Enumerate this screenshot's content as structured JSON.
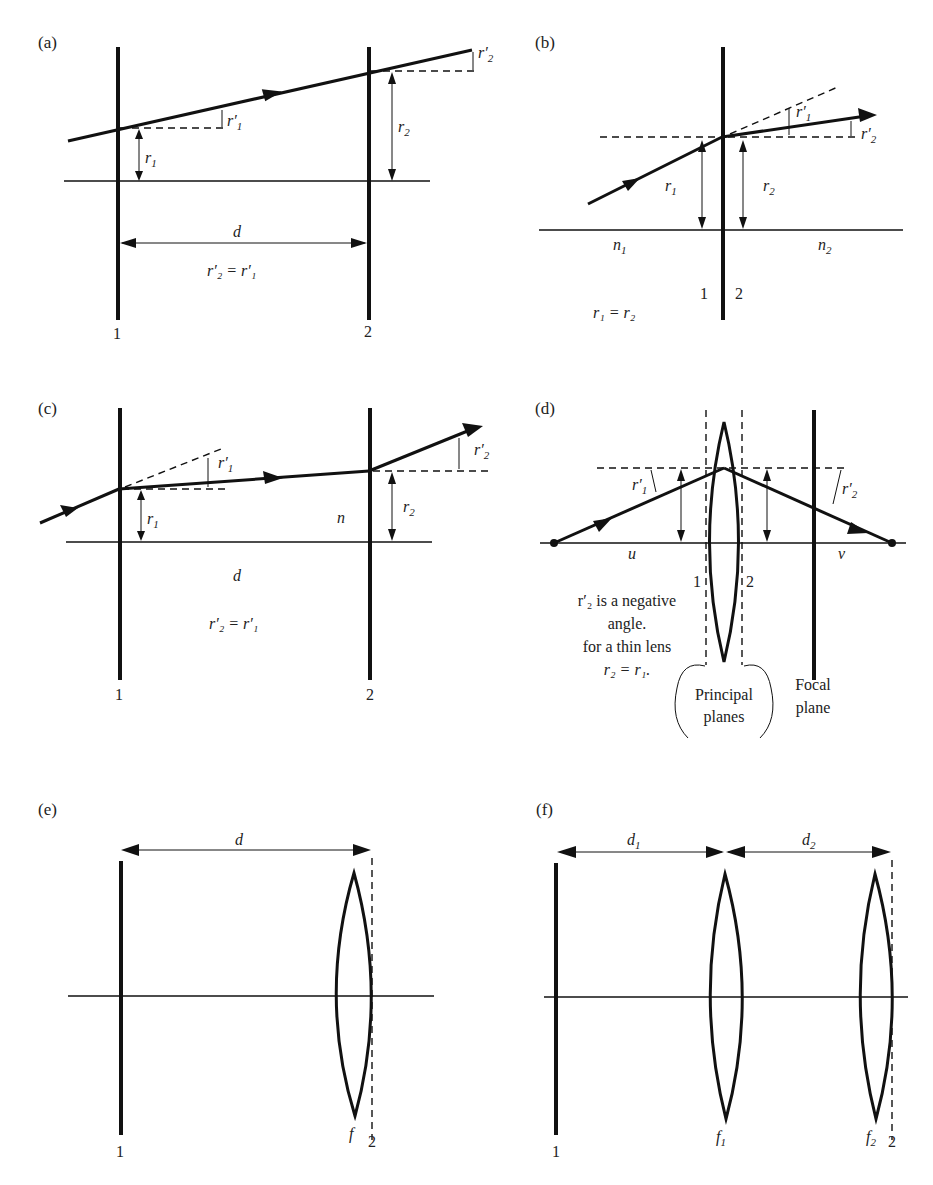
{
  "figure": {
    "panels": [
      {
        "id": "a",
        "label": "(a)",
        "plane_labels": [
          "1",
          "2"
        ],
        "symbols": {
          "r1": "r",
          "r1_sub": "1",
          "r1p": "r′",
          "r1p_sub": "1",
          "r2": "r",
          "r2_sub": "2",
          "r2p": "r′",
          "r2p_sub": "2",
          "d": "d"
        },
        "equation": "r′₂ = r′₁"
      },
      {
        "id": "b",
        "label": "(b)",
        "plane_labels": [
          "1",
          "2"
        ],
        "symbols": {
          "r1": "r",
          "r1_sub": "1",
          "r2": "r",
          "r2_sub": "2",
          "r1p": "r′",
          "r1p_sub": "1",
          "r2p": "r′",
          "r2p_sub": "2",
          "n1": "n",
          "n1_sub": "1",
          "n2": "n",
          "n2_sub": "2"
        },
        "equation": "r₁ = r₂"
      },
      {
        "id": "c",
        "label": "(c)",
        "plane_labels": [
          "1",
          "2"
        ],
        "symbols": {
          "r1": "r",
          "r1_sub": "1",
          "r1p": "r′",
          "r1p_sub": "1",
          "r2": "r",
          "r2_sub": "2",
          "r2p": "r′",
          "r2p_sub": "2",
          "n": "n",
          "d": "d"
        },
        "equation": "r′₂ = r′₁"
      },
      {
        "id": "d",
        "label": "(d)",
        "plane_labels": [
          "1",
          "2"
        ],
        "symbols": {
          "r1p": "r′",
          "r1p_sub": "1",
          "r2p": "r′",
          "r2p_sub": "2",
          "u": "u",
          "v": "v"
        },
        "note_lines": [
          "r′₂ is a negative",
          "angle.",
          "for a thin lens",
          "r₂ = r₁."
        ],
        "principal_planes": [
          "Principal",
          "planes"
        ],
        "focal_plane": [
          "Focal",
          "plane"
        ]
      },
      {
        "id": "e",
        "label": "(e)",
        "plane_labels": [
          "1",
          "2"
        ],
        "symbols": {
          "d": "d",
          "f": "f"
        }
      },
      {
        "id": "f",
        "label": "(f)",
        "plane_labels": [
          "1",
          "2"
        ],
        "symbols": {
          "d1": "d",
          "d1_sub": "1",
          "d2": "d",
          "d2_sub": "2",
          "f1": "f",
          "f1_sub": "1",
          "f2": "f",
          "f2_sub": "2"
        }
      }
    ]
  }
}
